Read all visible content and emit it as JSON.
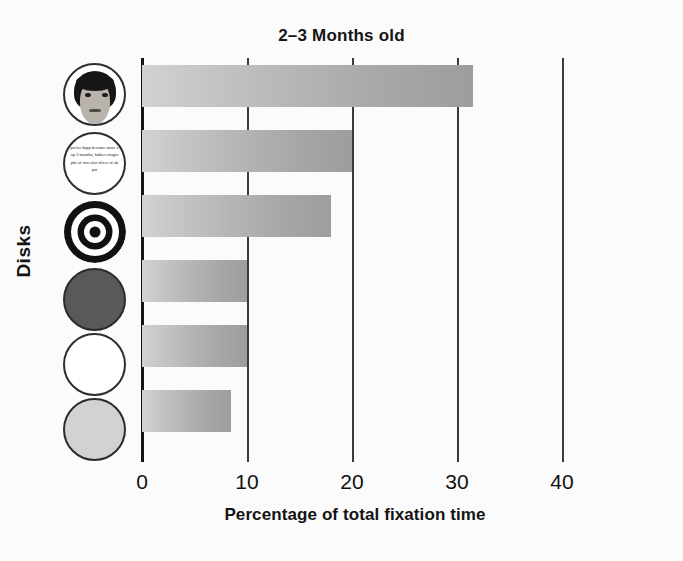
{
  "chart_data": {
    "type": "bar",
    "orientation": "horizontal",
    "title": "2–3 Months old",
    "xlabel": "Percentage of total fixation time",
    "ylabel": "Disks",
    "xlim": [
      0,
      40
    ],
    "xticks": [
      0,
      10,
      20,
      30,
      40
    ],
    "grid": true,
    "legend": "none",
    "categories": [
      "face",
      "newsprint",
      "bullseye",
      "red disk",
      "white disk",
      "yellow disk"
    ],
    "values": [
      31.5,
      20.0,
      18.0,
      10.0,
      10.0,
      8.5
    ],
    "series": [
      {
        "name": "Percentage of total fixation time",
        "values": [
          31.5,
          20.0,
          18.0,
          10.0,
          10.0,
          8.5
        ]
      }
    ],
    "bar_gradient_start": "#d2d2d2",
    "bar_gradient_end": "#9d9d9d"
  },
  "axis": {
    "tick_labels": [
      "0",
      "10",
      "20",
      "30",
      "40"
    ],
    "axis_color": "#141414",
    "gridline_color": "#3a3a3a"
  },
  "disks": [
    {
      "name": "face-disk",
      "kind": "face",
      "fill": "#b9b3ab",
      "outline": "#2e2e2e",
      "text": ""
    },
    {
      "name": "newsprint-disk",
      "kind": "newsprint",
      "fill": "#ffffff",
      "outline": "#2e2e2e",
      "text": "prefer happ become more sop 3 months, babies otographs of stra olor slices of nk pat"
    },
    {
      "name": "bullseye-disk",
      "kind": "bullseye",
      "fill": "#111111",
      "outline": "#111111",
      "text": ""
    },
    {
      "name": "red-disk",
      "kind": "solid",
      "fill": "#595959",
      "outline": "#2b2b2b",
      "text": ""
    },
    {
      "name": "white-disk",
      "kind": "solid",
      "fill": "#ffffff",
      "outline": "#2e2e2e",
      "text": ""
    },
    {
      "name": "yellow-disk",
      "kind": "solid",
      "fill": "#d2d2d2",
      "outline": "#2b2b2b",
      "text": ""
    }
  ]
}
